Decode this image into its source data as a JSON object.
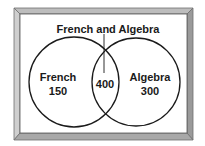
{
  "diagram": {
    "type": "venn",
    "title": "French and Algebra",
    "sets": [
      {
        "name": "French",
        "only_value": "150"
      },
      {
        "name": "Algebra",
        "only_value": "300"
      }
    ],
    "intersection": {
      "label": "French and Algebra",
      "value": "400"
    }
  },
  "labels": {
    "top": "French and Algebra",
    "left_name": "French",
    "left_value": "150",
    "center_value": "400",
    "right_name": "Algebra",
    "right_value": "300"
  },
  "colors": {
    "frame_light": "#d9d9d9",
    "frame_mid": "#a8a8a8",
    "frame_dark": "#6e6e6e",
    "stroke": "#1a1a1a",
    "background": "#ffffff"
  }
}
